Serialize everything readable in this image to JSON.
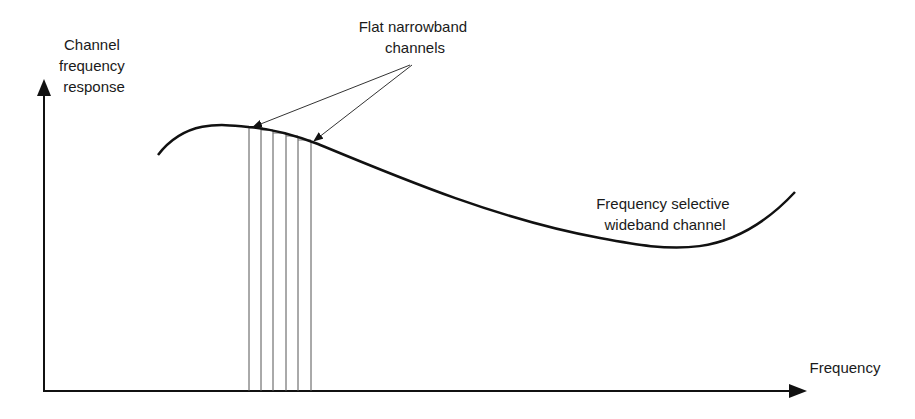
{
  "diagram": {
    "type": "channel-frequency-response",
    "y_axis_label": [
      "Channel",
      "frequency",
      "response"
    ],
    "x_axis_label": "Frequency",
    "annotation_narrowband": [
      "Flat narrowband",
      "channels"
    ],
    "annotation_wideband": [
      "Frequency selective",
      "wideband channel"
    ],
    "narrowband_channel_count": 5,
    "colors": {
      "ink": "#111111",
      "thin": "#555555",
      "background": "#ffffff"
    }
  }
}
